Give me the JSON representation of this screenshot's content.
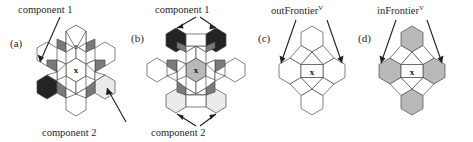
{
  "figure": {
    "type": "diagram",
    "background": "#ffffff",
    "colors": {
      "outline": "#4a4a4a",
      "white": "#ffffff",
      "very_dark": "#242424",
      "mid_gray": "#7a7a7a",
      "light_gray": "#b9b9b9",
      "very_light": "#ebebeb",
      "center_gray": "#b9b9b9",
      "text": "#1f1f1f"
    },
    "panels": [
      {
        "id": "a",
        "label": "(a)",
        "center_mark": "x",
        "annotations": [
          {
            "name": "component-1-label-a",
            "text": "component 1"
          },
          {
            "name": "component-2-label-a",
            "text": "component 2"
          }
        ]
      },
      {
        "id": "b",
        "label": "(b)",
        "center_mark": "x",
        "annotations": [
          {
            "name": "component-1-label-b",
            "text": "component 1"
          },
          {
            "name": "component-2-label-b",
            "text": "component 2"
          }
        ]
      },
      {
        "id": "c",
        "label": "(c)",
        "center_mark": "x",
        "annotations": [
          {
            "name": "out-frontier-label",
            "text": "outFrontier",
            "superscript": "V"
          }
        ]
      },
      {
        "id": "d",
        "label": "(d)",
        "center_mark": "x",
        "annotations": [
          {
            "name": "in-frontier-label",
            "text": "inFrontier",
            "superscript": "V"
          }
        ]
      }
    ]
  }
}
